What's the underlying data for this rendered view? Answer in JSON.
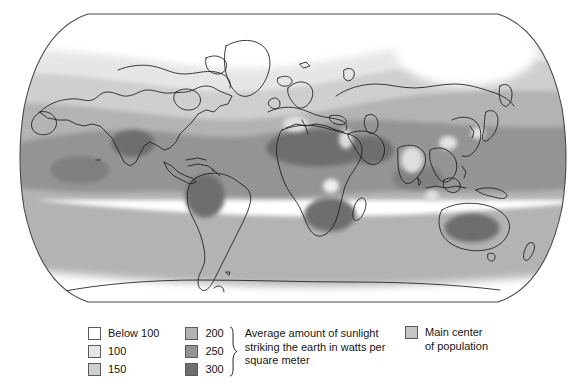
{
  "figure": {
    "projection": "robinson-like-oval"
  },
  "legend": {
    "sunlight_scale": {
      "column_one": [
        {
          "label": "Below 100",
          "color": "#ffffff"
        },
        {
          "label": "100",
          "color": "#e6e6e6"
        },
        {
          "label": "150",
          "color": "#cfcfcf"
        }
      ],
      "column_two": [
        {
          "label": "200",
          "color": "#b3b3b3"
        },
        {
          "label": "250",
          "color": "#949494"
        },
        {
          "label": "300",
          "color": "#6e6e6e"
        }
      ],
      "description": "Average amount of sunlight\nstriking the earth in watts per\nsquare meter",
      "description_lines": [
        "Average amount of sunlight",
        "striking the earth in watts per",
        "square meter"
      ],
      "brace": "}"
    },
    "population": {
      "label_lines": [
        "Main center",
        "of population"
      ],
      "swatch_color": "#c6c6c6"
    }
  },
  "colors": {
    "below_100": "#ffffff",
    "v100": "#e6e6e6",
    "v150": "#cfcfcf",
    "v200": "#b3b3b3",
    "v250": "#949494",
    "v300": "#6e6e6e",
    "population_patch": "#dedede",
    "coastline": "#1c1c1c",
    "map_border": "#4a4a4a",
    "background": "#ffffff"
  },
  "map_regions": {
    "darkest_300": [
      "Sahara Desert",
      "Arabian Peninsula",
      "Southern Africa interior",
      "Australia interior",
      "Mexico / Baja",
      "Central South America"
    ],
    "population_centers": [
      "Western Europe",
      "Nile Valley / Egypt",
      "India",
      "Central Africa",
      "Eastern China",
      "Japan"
    ],
    "lightest_below_100": [
      "Arctic / Greenland",
      "Northern Canada",
      "Antarctica",
      "Northern Siberia"
    ]
  }
}
